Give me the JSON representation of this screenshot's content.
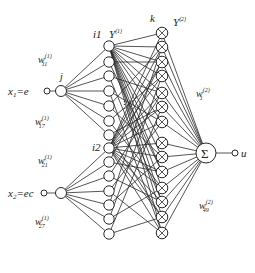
{
  "diagram": {
    "type": "neural-network",
    "inputs": [
      {
        "label": "x1=e",
        "var": "x",
        "sub": "1",
        "expr": "=e",
        "cx": 47,
        "cy": 91,
        "hidden_cx": 61
      },
      {
        "label": "x2=ec",
        "var": "x",
        "sub": "2",
        "expr": "=ec",
        "cx": 44,
        "cy": 193,
        "hidden_cx": 61
      }
    ],
    "labels": {
      "j": "j",
      "i1": "i1",
      "i2": "i2",
      "k": "k",
      "y1": "Y",
      "y1_sup": "(1)",
      "y2": "Y",
      "y2_sup": "(2)",
      "output": "u",
      "ellipsis": "⋮",
      "sum_symbol": "Σ"
    },
    "weights": [
      {
        "id": "w11",
        "base": "w",
        "sup": "(1)",
        "sub": "11",
        "x": 38,
        "y": 63
      },
      {
        "id": "w17",
        "base": "w",
        "sup": "(1)",
        "sub": "17",
        "x": 35,
        "y": 125
      },
      {
        "id": "w21",
        "base": "w",
        "sup": "(1)",
        "sub": "21",
        "x": 38,
        "y": 164
      },
      {
        "id": "w27",
        "base": "w",
        "sup": "(1)",
        "sub": "27",
        "x": 35,
        "y": 225
      },
      {
        "id": "w1_2",
        "base": "w",
        "sup": "(2)",
        "sub": "1",
        "x": 196,
        "y": 97
      },
      {
        "id": "w49_2",
        "base": "w",
        "sup": "(2)",
        "sub": "49",
        "x": 199,
        "y": 209
      }
    ],
    "layer1_nodes_x": 109,
    "layer1_top_y": [
      46,
      62,
      76,
      91,
      106,
      121,
      135
    ],
    "layer1_bottom_y": [
      148,
      162,
      176,
      191,
      205,
      219,
      234
    ],
    "layer2_nodes_x": 162,
    "layer2_y": [
      33,
      47,
      62,
      76,
      93,
      107,
      122,
      143,
      157,
      172,
      188,
      202,
      217,
      233
    ],
    "sum_node": {
      "cx": 206,
      "cy": 153,
      "r": 10
    },
    "output_node": {
      "cx": 235,
      "cy": 153
    }
  }
}
